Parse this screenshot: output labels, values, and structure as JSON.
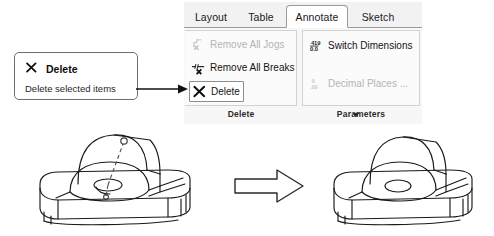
{
  "app": {
    "kind": "cad-ribbon-screenshot",
    "accent_color": "#ffffff",
    "ribbon_bg": "#f7f7f7",
    "tabstrip_bg": "#f2f2f2",
    "border_color": "#9a9a9a",
    "disabled_color": "#b4b4b4",
    "text_color": "#141414"
  },
  "ribbon": {
    "tabs": [
      {
        "label": "Layout",
        "active": false
      },
      {
        "label": "Table",
        "active": false
      },
      {
        "label": "Annotate",
        "active": true
      },
      {
        "label": "Sketch",
        "active": false
      }
    ],
    "panels": [
      {
        "name": "delete-panel",
        "label": "Delete",
        "has_dropdown": true,
        "dropdown_icon": "chevron-down-icon",
        "commands": [
          {
            "label": "Remove All Jogs",
            "icon": "remove-all-jogs-icon",
            "enabled": false,
            "hover": false
          },
          {
            "label": "Remove All Breaks",
            "icon": "remove-all-breaks-icon",
            "enabled": true,
            "hover": false
          },
          {
            "label": "Delete",
            "icon": "delete-x-icon",
            "enabled": true,
            "hover": true
          }
        ]
      },
      {
        "name": "parameters-panel",
        "label": "Parameters",
        "has_dropdown": false,
        "commands": [
          {
            "label": "Switch Dimensions",
            "icon": "switch-dimensions-icon",
            "enabled": true,
            "hover": false
          },
          {
            "label": "Decimal Places ...",
            "icon": "decimal-places-icon",
            "enabled": false,
            "hover": false
          }
        ]
      }
    ]
  },
  "tooltip": {
    "icon": "delete-x-icon",
    "title": "Delete",
    "description": "Delete selected items"
  },
  "annotation": {
    "pointer_icon": "arrow-right-pointer-icon",
    "transition_icon": "block-arrow-right-icon"
  },
  "illustration": {
    "before": {
      "name": "part-with-hole-annotation",
      "caption": "",
      "has_center_mark": true
    },
    "after": {
      "name": "part-without-annotation",
      "caption": "",
      "has_center_mark": false
    }
  }
}
